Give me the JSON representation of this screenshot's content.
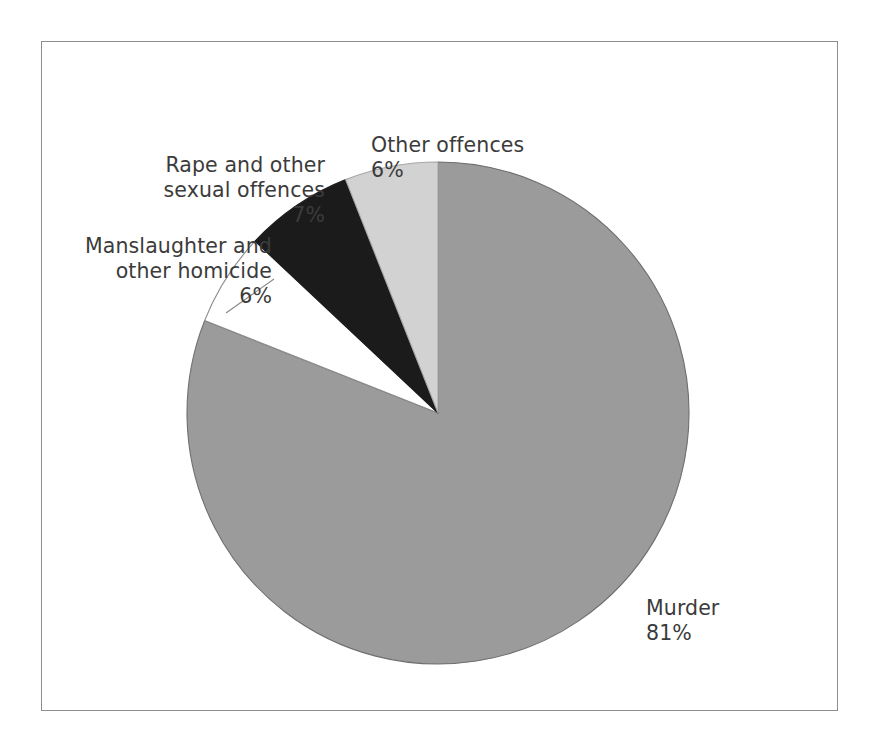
{
  "figure": {
    "background_color": "#ffffff",
    "frame_color": "#8e8e8e"
  },
  "chart_data": {
    "type": "pie",
    "title": "",
    "subtitle": "",
    "xlabel": "",
    "ylabel": "",
    "grid": false,
    "legend_position": "none",
    "labels_position": "outside-callout",
    "units": "percent",
    "start_angle_deg": 0,
    "direction": "clockwise",
    "categories": [
      "Murder",
      "Other offences",
      "Rape and other sexual offences",
      "Manslaughter and other homicide"
    ],
    "values": [
      81,
      6,
      7,
      6
    ],
    "colors": [
      "#9b9b9b",
      "#d2d2d2",
      "#1b1b1b",
      "#ffffff"
    ],
    "slices": [
      {
        "name": "Murder",
        "label": "Murder",
        "percent_text": "81%",
        "value": 81,
        "color": "#9b9b9b",
        "stroke": "#6f6f6f",
        "start_deg": 0,
        "end_deg": 291.6
      },
      {
        "name": "Manslaughter and other homicide",
        "label": "Manslaughter and\nother homicide",
        "percent_text": "6%",
        "value": 6,
        "color": "#ffffff",
        "stroke": "#8a8a8a",
        "start_deg": 291.6,
        "end_deg": 313.2
      },
      {
        "name": "Rape and other sexual offences",
        "label": "Rape and other\nsexual offences",
        "percent_text": "7%",
        "value": 7,
        "color": "#1b1b1b",
        "stroke": "#1b1b1b",
        "start_deg": 313.2,
        "end_deg": 338.4
      },
      {
        "name": "Other offences",
        "label": "Other offences",
        "percent_text": "6%",
        "value": 6,
        "color": "#d2d2d2",
        "stroke": "#a6a6a6",
        "start_deg": 338.4,
        "end_deg": 360
      }
    ]
  },
  "callouts": {
    "other_offences": {
      "label": "Other offences",
      "percent": "6%"
    },
    "rape": {
      "label": "Rape and other\nsexual offences",
      "percent": "7%"
    },
    "manslaughter": {
      "label": "Manslaughter and\nother homicide",
      "percent": "6%"
    },
    "murder": {
      "label": "Murder",
      "percent": "81%"
    }
  }
}
